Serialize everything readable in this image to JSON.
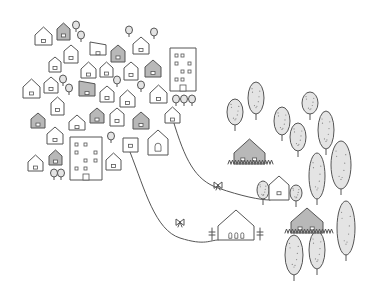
{
  "illustration": {
    "description": "Hand-drawn sketch of a dense town of small houses connected by winding paths to a countryside with houses and trees",
    "colors": {
      "stroke": "#555555",
      "gray_house": "#b8b8b8",
      "tree_fill": "#e4e4e4",
      "background": "#ffffff"
    },
    "town_houses": [
      {
        "x": 35,
        "y": 27,
        "w": 17,
        "h": 18,
        "shade": "white"
      },
      {
        "x": 57,
        "y": 23,
        "w": 13,
        "h": 17,
        "shade": "gray"
      },
      {
        "x": 64,
        "y": 45,
        "w": 14,
        "h": 18,
        "shade": "white"
      },
      {
        "x": 49,
        "y": 57,
        "w": 12,
        "h": 15,
        "shade": "white"
      },
      {
        "x": 90,
        "y": 42,
        "w": 16,
        "h": 13,
        "shade": "white",
        "skew": true
      },
      {
        "x": 111,
        "y": 45,
        "w": 14,
        "h": 17,
        "shade": "gray"
      },
      {
        "x": 133,
        "y": 37,
        "w": 16,
        "h": 17,
        "shade": "white"
      },
      {
        "x": 145,
        "y": 60,
        "w": 16,
        "h": 17,
        "shade": "gray"
      },
      {
        "x": 81,
        "y": 62,
        "w": 15,
        "h": 16,
        "shade": "white"
      },
      {
        "x": 100,
        "y": 62,
        "w": 13,
        "h": 15,
        "shade": "white"
      },
      {
        "x": 124,
        "y": 62,
        "w": 14,
        "h": 18,
        "shade": "white"
      },
      {
        "x": 23,
        "y": 79,
        "w": 17,
        "h": 19,
        "shade": "white"
      },
      {
        "x": 44,
        "y": 77,
        "w": 14,
        "h": 16,
        "shade": "white"
      },
      {
        "x": 79,
        "y": 81,
        "w": 16,
        "h": 15,
        "shade": "gray",
        "skew": true
      },
      {
        "x": 100,
        "y": 86,
        "w": 14,
        "h": 16,
        "shade": "white"
      },
      {
        "x": 120,
        "y": 90,
        "w": 15,
        "h": 17,
        "shade": "white"
      },
      {
        "x": 150,
        "y": 85,
        "w": 17,
        "h": 18,
        "shade": "white"
      },
      {
        "x": 51,
        "y": 97,
        "w": 13,
        "h": 18,
        "shade": "white"
      },
      {
        "x": 31,
        "y": 113,
        "w": 14,
        "h": 15,
        "shade": "gray"
      },
      {
        "x": 69,
        "y": 115,
        "w": 16,
        "h": 15,
        "shade": "white"
      },
      {
        "x": 90,
        "y": 108,
        "w": 14,
        "h": 15,
        "shade": "gray"
      },
      {
        "x": 110,
        "y": 108,
        "w": 14,
        "h": 18,
        "shade": "white"
      },
      {
        "x": 133,
        "y": 112,
        "w": 16,
        "h": 17,
        "shade": "gray"
      },
      {
        "x": 165,
        "y": 107,
        "w": 15,
        "h": 16,
        "shade": "white"
      },
      {
        "x": 47,
        "y": 127,
        "w": 16,
        "h": 17,
        "shade": "white"
      },
      {
        "x": 49,
        "y": 150,
        "w": 13,
        "h": 15,
        "shade": "gray"
      },
      {
        "x": 28,
        "y": 155,
        "w": 15,
        "h": 16,
        "shade": "white"
      },
      {
        "x": 106,
        "y": 153,
        "w": 15,
        "h": 17,
        "shade": "white"
      },
      {
        "x": 123,
        "y": 138,
        "w": 15,
        "h": 14,
        "shade": "white",
        "flat": true
      },
      {
        "x": 148,
        "y": 130,
        "w": 20,
        "h": 25,
        "shade": "white",
        "arch": true
      }
    ],
    "apartment_buildings": [
      {
        "x": 170,
        "y": 48,
        "w": 26,
        "h": 43
      },
      {
        "x": 70,
        "y": 137,
        "w": 32,
        "h": 43
      }
    ],
    "small_trees": [
      {
        "x": 76,
        "y": 25
      },
      {
        "x": 81,
        "y": 35
      },
      {
        "x": 129,
        "y": 30
      },
      {
        "x": 154,
        "y": 32
      },
      {
        "x": 63,
        "y": 79
      },
      {
        "x": 69,
        "y": 88
      },
      {
        "x": 117,
        "y": 80
      },
      {
        "x": 141,
        "y": 85
      },
      {
        "x": 111,
        "y": 136
      },
      {
        "x": 54,
        "y": 173
      },
      {
        "x": 61,
        "y": 173
      },
      {
        "x": 176,
        "y": 99
      },
      {
        "x": 184,
        "y": 99
      },
      {
        "x": 192,
        "y": 99
      }
    ],
    "country_houses": [
      {
        "x": 234,
        "y": 139,
        "w": 31,
        "h": 25,
        "shade": "gray",
        "grass": true
      },
      {
        "x": 269,
        "y": 176,
        "w": 20,
        "h": 24,
        "shade": "white"
      },
      {
        "x": 218,
        "y": 210,
        "w": 36,
        "h": 30,
        "shade": "white",
        "windows": 3
      },
      {
        "x": 291,
        "y": 208,
        "w": 32,
        "h": 25,
        "shade": "gray",
        "grass": true
      }
    ],
    "big_trees": [
      {
        "x": 235,
        "y": 112,
        "rx": 8,
        "ry": 13
      },
      {
        "x": 256,
        "y": 98,
        "rx": 8,
        "ry": 16
      },
      {
        "x": 282,
        "y": 121,
        "rx": 8,
        "ry": 14
      },
      {
        "x": 310,
        "y": 103,
        "rx": 8,
        "ry": 11
      },
      {
        "x": 298,
        "y": 137,
        "rx": 8,
        "ry": 14
      },
      {
        "x": 326,
        "y": 130,
        "rx": 8,
        "ry": 19
      },
      {
        "x": 317,
        "y": 176,
        "rx": 8,
        "ry": 23
      },
      {
        "x": 341,
        "y": 165,
        "rx": 10,
        "ry": 24
      },
      {
        "x": 346,
        "y": 228,
        "rx": 9,
        "ry": 27
      },
      {
        "x": 294,
        "y": 255,
        "rx": 9,
        "ry": 20
      },
      {
        "x": 317,
        "y": 250,
        "rx": 8,
        "ry": 19
      },
      {
        "x": 263,
        "y": 190,
        "rx": 6,
        "ry": 9
      },
      {
        "x": 296,
        "y": 193,
        "rx": 6,
        "ry": 8
      }
    ],
    "paths": [
      "M173 120 C 185 160, 195 180, 218 188 S 260 200, 270 200",
      "M130 152 C 145 190, 155 230, 180 238 S 210 240, 218 240"
    ]
  }
}
